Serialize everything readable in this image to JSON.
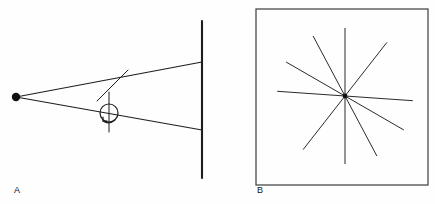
{
  "figure": {
    "background_color": "#fefefe",
    "ink_color": "#1d1d1d",
    "box_color": "#4a4a4a",
    "width": 435,
    "height": 204,
    "panels": [
      {
        "id": "A",
        "label": "A",
        "label_x": 14,
        "label_y": 193,
        "description": "point source projecting a cone of rays onto a vertical screen, with a rotating scatterer on an axis in the beam path",
        "source_point": {
          "x": 16,
          "y": 97,
          "radius": 4.2
        },
        "screen": {
          "x": 202,
          "y_top": 21,
          "y_bottom": 178
        },
        "rays": [
          {
            "name": "upper-ray",
            "x1": 16,
            "y1": 97,
            "x2": 202,
            "y2": 62
          },
          {
            "name": "lower-ray",
            "x1": 16,
            "y1": 97,
            "x2": 202,
            "y2": 130
          }
        ],
        "scatter_segment": {
          "name": "deflected-segment",
          "x1": 128,
          "y1": 70,
          "x2": 97,
          "y2": 101
        },
        "rotor": {
          "circle": {
            "cx": 109,
            "cy": 113,
            "r": 9
          },
          "axis": {
            "x": 109,
            "y_top": 92,
            "y_bottom": 132
          },
          "spin_arrow": "counter-clockwise"
        }
      },
      {
        "id": "B",
        "label": "B",
        "label_x": 257,
        "label_y": 193,
        "description": "square detector field showing a radial starburst of streaks converging on a central hub",
        "box": {
          "x": 256,
          "y": 9,
          "width": 172,
          "height": 176
        },
        "hub": {
          "x": 345,
          "y": 96,
          "radius": 2.4
        },
        "ray_count": 5,
        "ray_length": 68,
        "ray_angles_deg": [
          4,
          30,
          62,
          90,
          128
        ]
      }
    ]
  }
}
